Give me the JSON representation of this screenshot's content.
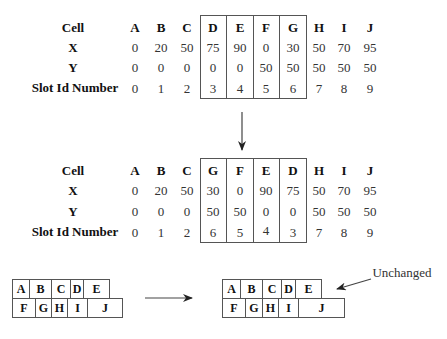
{
  "top_table": {
    "row_labels": [
      "Cell",
      "X",
      "Y",
      "Slot Id Number"
    ],
    "cells": [
      "A",
      "B",
      "C",
      "D",
      "E",
      "F",
      "G",
      "H",
      "I",
      "J"
    ],
    "x": [
      "0",
      "20",
      "50",
      "75",
      "90",
      "0",
      "30",
      "50",
      "70",
      "95"
    ],
    "y": [
      "0",
      "0",
      "0",
      "0",
      "0",
      "50",
      "50",
      "50",
      "50",
      "50"
    ],
    "slot": [
      "0",
      "1",
      "2",
      "3",
      "4",
      "5",
      "6",
      "7",
      "8",
      "9"
    ],
    "boxed_columns": [
      "D",
      "E",
      "F",
      "G"
    ]
  },
  "bottom_table": {
    "row_labels": [
      "Cell",
      "X",
      "Y",
      "Slot Id Number"
    ],
    "cells": [
      "A",
      "B",
      "C",
      "G",
      "F",
      "E",
      "D",
      "H",
      "I",
      "J"
    ],
    "x": [
      "0",
      "20",
      "50",
      "30",
      "0",
      "90",
      "75",
      "50",
      "70",
      "95"
    ],
    "y": [
      "0",
      "0",
      "0",
      "50",
      "50",
      "0",
      "0",
      "50",
      "50",
      "50"
    ],
    "slot": [
      "0",
      "1",
      "2",
      "6",
      "5",
      "4",
      "3",
      "7",
      "8",
      "9"
    ],
    "boxed_columns": [
      "G",
      "F",
      "E",
      "D"
    ]
  },
  "layout_before": {
    "row1": [
      "A",
      "B",
      "C",
      "D",
      "E"
    ],
    "row2": [
      "F",
      "G",
      "H",
      "I",
      "J"
    ]
  },
  "layout_after": {
    "row1": [
      "A",
      "B",
      "C",
      "D",
      "E"
    ],
    "row2": [
      "F",
      "G",
      "H",
      "I",
      "J"
    ]
  },
  "annotation": {
    "label": "Unchanged"
  }
}
